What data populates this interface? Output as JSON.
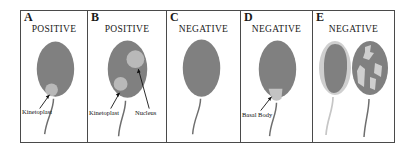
{
  "figure": {
    "colors": {
      "body_gray": "#808080",
      "organelle_light": "#b9b9b9",
      "halo_light": "#cfcfcf",
      "patch_light": "#cfcfcf",
      "flagellum_dark": "#6e6e6e",
      "flagellum_light": "#c6c6c6",
      "border": "#4a4a4a",
      "text": "#1a1a1a",
      "background": "#ffffff"
    }
  },
  "panels": [
    {
      "letter": "A",
      "status": "POSITIVE",
      "annotations": [
        {
          "label": "Kinetoplast"
        }
      ]
    },
    {
      "letter": "B",
      "status": "POSITIVE",
      "annotations": [
        {
          "label": "Kinetoplast"
        },
        {
          "label": "Nucleus"
        }
      ]
    },
    {
      "letter": "C",
      "status": "NEGATIVE",
      "annotations": []
    },
    {
      "letter": "D",
      "status": "NEGATIVE",
      "annotations": [
        {
          "label": "Basal Body"
        }
      ]
    },
    {
      "letter": "E",
      "status": "NEGATIVE",
      "annotations": []
    }
  ]
}
